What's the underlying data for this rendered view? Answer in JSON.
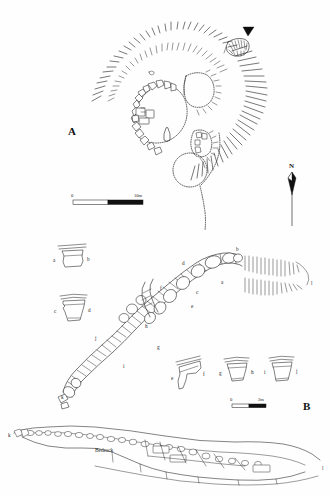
{
  "figure": {
    "background_color": "#fefefe",
    "ink_color": "#1d1d1d"
  },
  "panels": [
    {
      "id": "A",
      "label": "A",
      "type": "site-plan",
      "description": "Plan of circular stone structures enclosed by hachured slope",
      "scale_bar": {
        "start": "0",
        "end": "10m"
      },
      "north_arrow": {
        "label": "N"
      },
      "entrance_marker": "black-triangle-pointer"
    },
    {
      "id": "B",
      "label": "B",
      "type": "wall-plan",
      "description": "Plan of curved stone wall with lettered section points",
      "scale_bar": {
        "start": "0",
        "end": "2m"
      },
      "section_points": [
        "a",
        "b",
        "c",
        "d",
        "e",
        "f",
        "g",
        "h",
        "i",
        "j",
        "k",
        "l"
      ]
    },
    {
      "id": "C",
      "label": "",
      "type": "cross-section",
      "description": "Longitudinal cross-section through wall and deposits",
      "strata_labels": [
        "Bedrock"
      ],
      "end_points": [
        "k",
        "l"
      ]
    }
  ],
  "panelA": {
    "letter": "A",
    "scale": {
      "zero": "0",
      "max": "10m"
    },
    "north": "N"
  },
  "panelB": {
    "letter": "B",
    "scale": {
      "zero": "0",
      "max": "2m"
    },
    "wall_markers": [
      {
        "id": "a",
        "label": "a",
        "x": 221,
        "y": 284
      },
      {
        "id": "b",
        "label": "b",
        "x": 236,
        "y": 255
      },
      {
        "id": "c",
        "label": "c",
        "x": 196,
        "y": 294
      },
      {
        "id": "d",
        "label": "d",
        "x": 182,
        "y": 265
      },
      {
        "id": "e",
        "label": "e",
        "x": 191,
        "y": 308
      },
      {
        "id": "f",
        "label": "f",
        "x": 163,
        "y": 290
      },
      {
        "id": "g",
        "label": "g",
        "x": 157,
        "y": 347
      },
      {
        "id": "h",
        "label": "h",
        "x": 146,
        "y": 328
      },
      {
        "id": "i",
        "label": "i",
        "x": 123,
        "y": 366
      },
      {
        "id": "j",
        "label": "j",
        "x": 95,
        "y": 338
      },
      {
        "id": "k",
        "label": "k",
        "x": 63,
        "y": 393
      },
      {
        "id": "l",
        "label": "l",
        "x": 311,
        "y": 283
      }
    ],
    "profiles": [
      {
        "pair": "ab",
        "left_label": "a",
        "right_label": "b",
        "x": 55,
        "y": 246
      },
      {
        "pair": "cd",
        "left_label": "c",
        "right_label": "d",
        "x": 55,
        "y": 296
      },
      {
        "pair": "ef",
        "left_label": "e",
        "right_label": "f",
        "x": 172,
        "y": 358
      },
      {
        "pair": "gh",
        "left_label": "g",
        "right_label": "h",
        "x": 222,
        "y": 358
      },
      {
        "pair": "ij",
        "left_label": "i",
        "right_label": "j",
        "x": 267,
        "y": 358
      }
    ]
  },
  "panelC": {
    "bedrock_label": "Bedrock",
    "left_end_label": "k",
    "right_end_label": "l"
  }
}
